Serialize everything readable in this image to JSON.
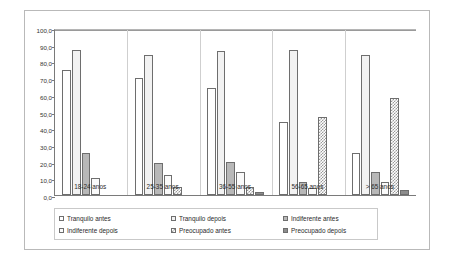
{
  "chart_data": {
    "type": "bar",
    "title": "",
    "subtitle": "",
    "xlabel": "",
    "ylabel": "",
    "ylim": [
      0.0,
      100.0
    ],
    "ytick_step": 10.0,
    "yticks": [
      "0,0",
      "10,0",
      "20,0",
      "30,0",
      "40,0",
      "50,0",
      "60,0",
      "70,0",
      "80,0",
      "90,0",
      "100,0"
    ],
    "grid": true,
    "grid_axis": "none",
    "legend_position": "bottom",
    "orientation": "vertical",
    "categories": [
      "18-24 anos",
      "25-35 anos",
      "36-55 anos",
      "56-65 anos",
      "> 65 anos"
    ],
    "series": [
      {
        "name": "Tranquilo antes",
        "fill": "none",
        "values": [
          75.0,
          70.0,
          64.0,
          44.0,
          25.0
        ]
      },
      {
        "name": "Tranquilo depois",
        "fill": "solid-light",
        "values": [
          87.0,
          84.0,
          86.0,
          87.0,
          84.0
        ]
      },
      {
        "name": "Indiferente antes",
        "fill": "gray",
        "values": [
          25.0,
          19.0,
          20.0,
          8.0,
          14.0
        ]
      },
      {
        "name": "Indiferente depois",
        "fill": "very-light",
        "values": [
          10.0,
          12.0,
          14.0,
          4.0,
          8.0
        ]
      },
      {
        "name": "Preocupado antes",
        "fill": "checker",
        "values": [
          0.0,
          5.0,
          5.0,
          47.0,
          58.0
        ]
      },
      {
        "name": "Preocupado depois",
        "fill": "dark",
        "values": [
          0.0,
          0.0,
          2.0,
          0.0,
          3.0
        ]
      }
    ]
  },
  "legend": {
    "items": [
      {
        "label": "Tranquilo antes",
        "fill": "none"
      },
      {
        "label": "Tranquilo depois",
        "fill": "solid-light"
      },
      {
        "label": "Indiferente antes",
        "fill": "gray"
      },
      {
        "label": "Indiferente depois",
        "fill": "very-light"
      },
      {
        "label": "Preocupado antes",
        "fill": "checker"
      },
      {
        "label": "Preocupado depois",
        "fill": "dark"
      }
    ]
  },
  "colors": {
    "bar_outline": "#6e6e6e",
    "axis": "#7a7a7a",
    "gridline": "#d9d9d9",
    "frame": "#b9b9b9",
    "text": "#2b2b2b",
    "background": "#ffffff"
  }
}
